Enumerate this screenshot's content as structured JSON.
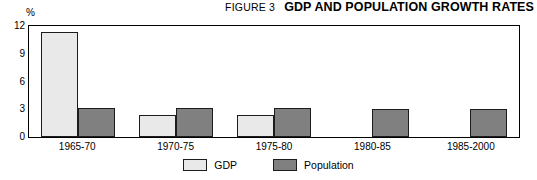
{
  "header": {
    "figure_number": "FIGURE 3",
    "title": "GDP AND POPULATION GROWTH RATES"
  },
  "legend": {
    "items": [
      {
        "label": "GDP",
        "color": "#e9e9e9",
        "swatch_name": "legend-swatch-gdp"
      },
      {
        "label": "Population",
        "color": "#808080",
        "swatch_name": "legend-swatch-population"
      }
    ]
  },
  "axis": {
    "unit": "%",
    "y_ticks": [
      "0",
      "3",
      "6",
      "9",
      "12"
    ],
    "y_tick_values": [
      0,
      3,
      6,
      9,
      12
    ]
  },
  "chart_data": {
    "type": "bar",
    "title": "GDP AND POPULATION GROWTH RATES",
    "subtitle": "FIGURE 3",
    "xlabel": "",
    "ylabel": "%",
    "ylim": [
      0,
      12
    ],
    "yticks": [
      0,
      3,
      6,
      9,
      12
    ],
    "grid": false,
    "legend_position": "bottom-center",
    "categories": [
      "1965-70",
      "1970-75",
      "1975-80",
      "1980-85",
      "1985-2000"
    ],
    "series": [
      {
        "name": "GDP",
        "color": "#e9e9e9",
        "values": [
          11.3,
          2.4,
          2.4,
          null,
          null
        ]
      },
      {
        "name": "Population",
        "color": "#808080",
        "values": [
          3.1,
          3.1,
          3.1,
          3.0,
          3.0
        ]
      }
    ]
  }
}
